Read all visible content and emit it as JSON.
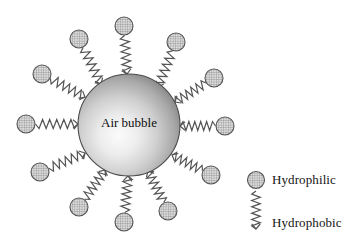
{
  "figure": {
    "kind": "surfactant-adsorption-diagram",
    "background_color": "#ffffff",
    "bubble": {
      "label": "Air bubble",
      "center_x": 129,
      "center_y": 125,
      "radius": 51,
      "fill_light": "#f2f2f2",
      "fill_mid": "#b8b8b8",
      "fill_dark": "#6f6f6f",
      "stroke": "#4a4a4a",
      "highlight_x": 118,
      "highlight_y": 138
    },
    "head": {
      "radius": 9,
      "fill": "#d9d9d9",
      "stroke": "#555555",
      "hatch_color": "#6d6d6d",
      "hatch_spacing": 2.4
    },
    "tail": {
      "stroke": "#555555",
      "stroke_width": 1.2,
      "zigzag_count": 6,
      "amplitude": 4.5
    },
    "molecules": [
      {
        "name": "molecule-n",
        "angle_deg": 270,
        "head_x": 124,
        "head_y": 26,
        "tail_inner_x": 127,
        "tail_inner_y": 74
      },
      {
        "name": "molecule-nne",
        "angle_deg": 305,
        "head_x": 176,
        "head_y": 42,
        "tail_inner_x": 158,
        "tail_inner_y": 87
      },
      {
        "name": "molecule-ene",
        "angle_deg": 333,
        "head_x": 214,
        "head_y": 78,
        "tail_inner_x": 175,
        "tail_inner_y": 102
      },
      {
        "name": "molecule-e",
        "angle_deg": 2,
        "head_x": 225,
        "head_y": 126,
        "tail_inner_x": 180,
        "tail_inner_y": 126
      },
      {
        "name": "molecule-ese",
        "angle_deg": 31,
        "head_x": 211,
        "head_y": 175,
        "tail_inner_x": 172,
        "tail_inner_y": 155
      },
      {
        "name": "molecule-sse",
        "angle_deg": 61,
        "head_x": 168,
        "head_y": 211,
        "tail_inner_x": 148,
        "tail_inner_y": 171
      },
      {
        "name": "molecule-s",
        "angle_deg": 91,
        "head_x": 124,
        "head_y": 222,
        "tail_inner_x": 128,
        "tail_inner_y": 176
      },
      {
        "name": "molecule-ssw",
        "angle_deg": 118,
        "head_x": 79,
        "head_y": 207,
        "tail_inner_x": 105,
        "tail_inner_y": 170
      },
      {
        "name": "molecule-wsw",
        "angle_deg": 148,
        "head_x": 40,
        "head_y": 172,
        "tail_inner_x": 85,
        "tail_inner_y": 153
      },
      {
        "name": "molecule-w",
        "angle_deg": 179,
        "head_x": 26,
        "head_y": 124,
        "tail_inner_x": 78,
        "tail_inner_y": 124
      },
      {
        "name": "molecule-wnw",
        "angle_deg": 209,
        "head_x": 42,
        "head_y": 74,
        "tail_inner_x": 85,
        "tail_inner_y": 97
      },
      {
        "name": "molecule-nnw",
        "angle_deg": 238,
        "head_x": 79,
        "head_y": 39,
        "tail_inner_x": 101,
        "tail_inner_y": 84
      }
    ],
    "legend": {
      "hydrophilic_label": "Hydrophilic",
      "hydrophobic_label": "Hydrophobic",
      "head_x": 256,
      "head_y": 180,
      "tail_top_y": 191,
      "tail_bottom_y": 229,
      "tail_x": 256
    }
  }
}
